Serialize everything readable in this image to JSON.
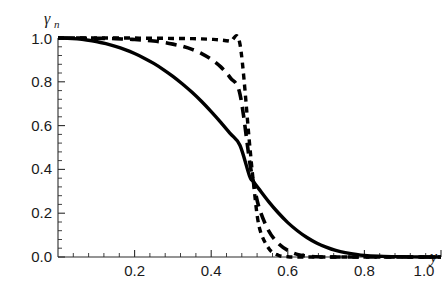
{
  "chart_data": {
    "type": "line",
    "title": "",
    "xlabel": "y",
    "ylabel": "γ",
    "ylabel_sub": "n",
    "xlim": [
      0.0,
      1.0
    ],
    "ylim": [
      0.0,
      1.0
    ],
    "grid": false,
    "legend": "none",
    "xticks": [
      "0.2",
      "0.4",
      "0.6",
      "0.8",
      "1.0"
    ],
    "xtick_values": [
      0.2,
      0.4,
      0.6,
      0.8,
      1.0
    ],
    "yticks": [
      "0.0",
      "0.2",
      "0.4",
      "0.6",
      "0.8",
      "1.0"
    ],
    "ytick_values": [
      0.0,
      0.2,
      0.4,
      0.6,
      0.8,
      1.0
    ],
    "x": [
      0.0,
      0.025,
      0.05,
      0.075,
      0.1,
      0.125,
      0.15,
      0.175,
      0.2,
      0.225,
      0.25,
      0.275,
      0.3,
      0.325,
      0.35,
      0.375,
      0.4,
      0.425,
      0.45,
      0.475,
      0.5,
      0.51,
      0.525,
      0.55,
      0.575,
      0.6,
      0.625,
      0.65,
      0.675,
      0.7,
      0.725,
      0.75,
      0.8,
      0.85,
      0.9,
      0.95,
      1.0
    ],
    "series": [
      {
        "name": "solid",
        "style": "solid",
        "dash": "none",
        "values": [
          1.0,
          0.999,
          0.996,
          0.991,
          0.984,
          0.974,
          0.962,
          0.947,
          0.929,
          0.908,
          0.884,
          0.856,
          0.825,
          0.79,
          0.752,
          0.71,
          0.664,
          0.615,
          0.563,
          0.51,
          0.37,
          0.345,
          0.31,
          0.253,
          0.202,
          0.157,
          0.12,
          0.089,
          0.064,
          0.045,
          0.03,
          0.02,
          0.007,
          0.003,
          0.001,
          0.0,
          0.0
        ]
      },
      {
        "name": "long-dash",
        "style": "dashed",
        "dash": "long",
        "values": [
          1.0,
          1.0,
          1.0,
          0.999,
          0.999,
          0.998,
          0.997,
          0.995,
          0.993,
          0.99,
          0.986,
          0.98,
          0.972,
          0.962,
          0.948,
          0.929,
          0.903,
          0.868,
          0.818,
          0.745,
          0.44,
          0.345,
          0.225,
          0.12,
          0.062,
          0.03,
          0.012,
          0.004,
          0.001,
          0.0,
          0.0,
          0.0,
          0.0,
          0.0,
          0.0,
          0.0,
          0.0
        ]
      },
      {
        "name": "short-dash",
        "style": "dashed",
        "dash": "short",
        "values": [
          1.0,
          1.0,
          1.0,
          1.0,
          1.0,
          1.0,
          1.0,
          1.0,
          1.0,
          0.999,
          0.999,
          0.999,
          0.998,
          0.998,
          0.997,
          0.996,
          0.994,
          0.991,
          0.985,
          0.973,
          0.52,
          0.345,
          0.14,
          0.04,
          0.008,
          0.001,
          0.0,
          0.0,
          0.0,
          0.0,
          0.0,
          0.0,
          0.0,
          0.0,
          0.0,
          0.0,
          0.0
        ]
      }
    ],
    "crossing_point": [
      0.51,
      0.345
    ]
  }
}
